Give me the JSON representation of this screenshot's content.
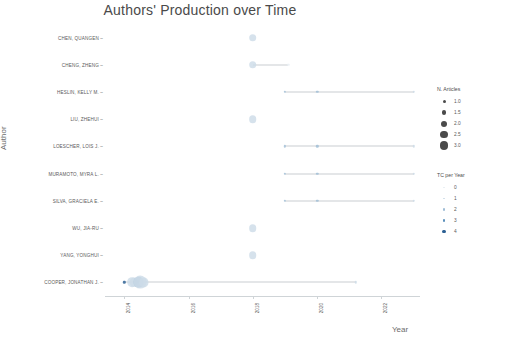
{
  "chart": {
    "title": "Authors' Production over Time",
    "xlabel": "Year",
    "ylabel": "Author"
  },
  "legend_articles": {
    "title": "N. Articles",
    "entries": [
      {
        "label": "1.0",
        "size": 3.0
      },
      {
        "label": "1.5",
        "size": 4.6
      },
      {
        "label": "2.0",
        "size": 6.0
      },
      {
        "label": "2.5",
        "size": 7.4
      },
      {
        "label": "3.0",
        "size": 8.8
      }
    ]
  },
  "legend_tc": {
    "title": "TC per Year",
    "entries": [
      {
        "label": "0",
        "size": 1.4,
        "color": "#e8eef3"
      },
      {
        "label": "1",
        "size": 1.9,
        "color": "#cddce8"
      },
      {
        "label": "2",
        "size": 2.4,
        "color": "#9fbdd6"
      },
      {
        "label": "3",
        "size": 2.9,
        "color": "#5c90bb"
      },
      {
        "label": "4",
        "size": 3.4,
        "color": "#2b5f93"
      }
    ]
  },
  "chart_data": {
    "type": "scatter",
    "title": "Authors' Production over Time",
    "xlabel": "Year",
    "ylabel": "Author",
    "xlim": [
      2013.4,
      2023.2
    ],
    "xticks": [
      "2014",
      "2016",
      "2018",
      "2020",
      "2022"
    ],
    "xtick_values": [
      2014,
      2016,
      2018,
      2020,
      2022
    ],
    "grid": false,
    "legend_position": "right",
    "size_legend": "N. Articles",
    "color_legend": "TC per Year",
    "authors": [
      "CHEN, QUANGEN",
      "CHENG, ZHENG",
      "HESLIN, KELLY M.",
      "LIU, ZHEHUI",
      "LOESCHER, LOIS J.",
      "MURAMOTO, MYRA L.",
      "SILVA, GRACIELA E.",
      "WU, JIA-RU",
      "YANG, YONGHUI",
      "COOPER, JONATHAN J."
    ],
    "series": [
      {
        "author": "CHEN, QUANGEN",
        "points": [
          {
            "year": 2018,
            "n_articles": 2.0,
            "tc_per_year": 1
          }
        ]
      },
      {
        "author": "CHENG, ZHENG",
        "points": [
          {
            "year": 2018,
            "n_articles": 2.0,
            "tc_per_year": 1
          },
          {
            "year": 2019.1,
            "n_articles": 1.0,
            "tc_per_year": 0
          }
        ]
      },
      {
        "author": "HESLIN, KELLY M.",
        "points": [
          {
            "year": 2019.0,
            "n_articles": 1.0,
            "tc_per_year": 2
          },
          {
            "year": 2020.0,
            "n_articles": 1.0,
            "tc_per_year": 2
          },
          {
            "year": 2023.0,
            "n_articles": 1.0,
            "tc_per_year": 1
          }
        ]
      },
      {
        "author": "LIU, ZHEHUI",
        "points": [
          {
            "year": 2018,
            "n_articles": 2.0,
            "tc_per_year": 1
          }
        ]
      },
      {
        "author": "LOESCHER, LOIS J.",
        "points": [
          {
            "year": 2019.0,
            "n_articles": 1.0,
            "tc_per_year": 2
          },
          {
            "year": 2020.0,
            "n_articles": 1.0,
            "tc_per_year": 2
          },
          {
            "year": 2023.0,
            "n_articles": 1.0,
            "tc_per_year": 1
          }
        ]
      },
      {
        "author": "MURAMOTO, MYRA L.",
        "points": [
          {
            "year": 2019.0,
            "n_articles": 1.0,
            "tc_per_year": 2
          },
          {
            "year": 2020.0,
            "n_articles": 1.0,
            "tc_per_year": 2
          },
          {
            "year": 2023.0,
            "n_articles": 1.0,
            "tc_per_year": 1
          }
        ]
      },
      {
        "author": "SILVA, GRACIELA E.",
        "points": [
          {
            "year": 2019.0,
            "n_articles": 1.0,
            "tc_per_year": 2
          },
          {
            "year": 2020.0,
            "n_articles": 1.0,
            "tc_per_year": 2
          },
          {
            "year": 2023.0,
            "n_articles": 1.0,
            "tc_per_year": 1
          }
        ]
      },
      {
        "author": "WU, JIA-RU",
        "points": [
          {
            "year": 2018,
            "n_articles": 2.0,
            "tc_per_year": 1
          }
        ]
      },
      {
        "author": "YANG, YONGHUI",
        "points": [
          {
            "year": 2018,
            "n_articles": 2.0,
            "tc_per_year": 1
          }
        ]
      },
      {
        "author": "COOPER, JONATHAN J.",
        "points": [
          {
            "year": 2014.0,
            "n_articles": 1.0,
            "tc_per_year": 4
          },
          {
            "year": 2014.25,
            "n_articles": 2.4,
            "tc_per_year": 1
          },
          {
            "year": 2014.3,
            "n_articles": 2.2,
            "tc_per_year": 1
          },
          {
            "year": 2014.45,
            "n_articles": 2.6,
            "tc_per_year": 2
          },
          {
            "year": 2014.6,
            "n_articles": 2.3,
            "tc_per_year": 1
          },
          {
            "year": 2014.5,
            "n_articles": 3.0,
            "tc_per_year": 1
          },
          {
            "year": 2021.2,
            "n_articles": 1.0,
            "tc_per_year": 1
          }
        ]
      }
    ]
  }
}
